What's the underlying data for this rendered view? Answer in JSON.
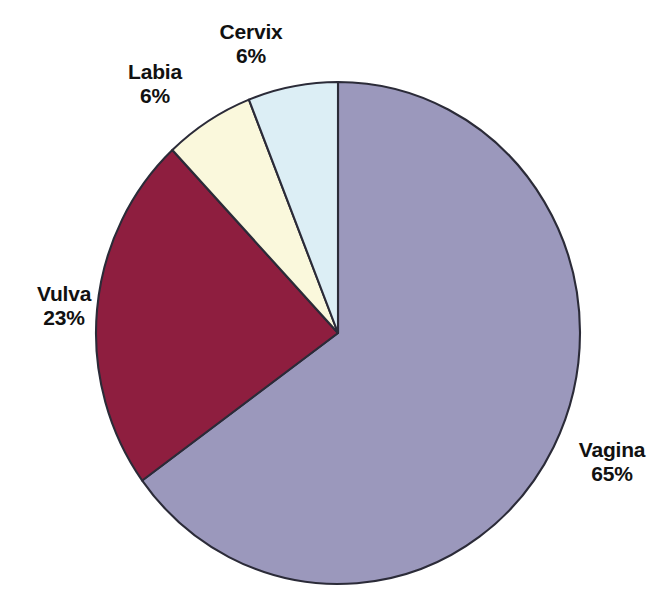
{
  "chart_data": {
    "type": "pie",
    "title": "",
    "subtitle": "",
    "xlabel": "",
    "ylabel": "",
    "legend": "none",
    "grid": false,
    "start_angle_deg": 0,
    "direction": "clockwise",
    "value_unit": "percent",
    "categories": [
      "Vagina",
      "Vulva",
      "Labia",
      "Cervix"
    ],
    "values": [
      65,
      23,
      6,
      6
    ],
    "value_labels": [
      "65%",
      "23%",
      "6%",
      "6%"
    ],
    "colors": [
      "#9b98bc",
      "#8e1e3f",
      "#faf8dc",
      "#dceef5"
    ],
    "slices": [
      {
        "name": "Vagina",
        "value": 65,
        "value_label": "65%",
        "color": "#9b98bc",
        "label_name": "Vagina",
        "label_value": "65%"
      },
      {
        "name": "Vulva",
        "value": 23,
        "value_label": "23%",
        "color": "#8e1e3f",
        "label_name": "Vulva",
        "label_value": "23%"
      },
      {
        "name": "Labia",
        "value": 6,
        "value_label": "6%",
        "color": "#faf8dc",
        "label_name": "Labia",
        "label_value": "6%"
      },
      {
        "name": "Cervix",
        "value": 6,
        "value_label": "6%",
        "color": "#dceef5",
        "label_name": "Cervix",
        "label_value": "6%"
      }
    ],
    "total": 100,
    "outline_color": "#2b2b38",
    "background_color": "#ffffff"
  },
  "geometry": {
    "center_x": 338,
    "center_y": 333,
    "radius_x": 242,
    "radius_y": 251
  }
}
